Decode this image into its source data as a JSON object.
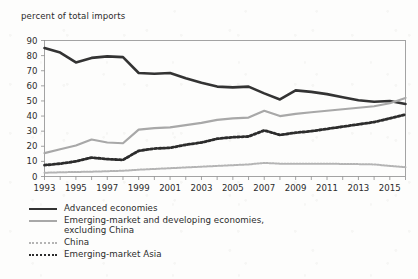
{
  "chart_data": {
    "type": "line",
    "title": "",
    "ylabel": "percent of total imports",
    "xlabel": "",
    "ylim": [
      0,
      90
    ],
    "xlim": [
      1993,
      2016
    ],
    "grid": false,
    "legend_position": "below-left",
    "yticks": [
      "0",
      "10",
      "20",
      "30",
      "40",
      "50",
      "60",
      "70",
      "80",
      "90"
    ],
    "ytick_values": [
      0,
      10,
      20,
      30,
      40,
      50,
      60,
      70,
      80,
      90
    ],
    "xticks": [
      "1993",
      "1995",
      "1997",
      "1999",
      "2001",
      "2003",
      "2005",
      "2007",
      "2009",
      "2011",
      "2013",
      "2015"
    ],
    "xtick_values": [
      1993,
      1995,
      1997,
      1999,
      2001,
      2003,
      2005,
      2007,
      2009,
      2011,
      2013,
      2015
    ],
    "x": [
      1993,
      1994,
      1995,
      1996,
      1997,
      1998,
      1999,
      2000,
      2001,
      2002,
      2003,
      2004,
      2005,
      2006,
      2007,
      2008,
      2009,
      2010,
      2011,
      2012,
      2013,
      2014,
      2015,
      2016
    ],
    "series": [
      {
        "name": "Advanced economies",
        "style": "solid",
        "color": "#333333",
        "width": 2.6,
        "values": [
          85,
          82,
          75.5,
          78.5,
          79.5,
          79,
          68.5,
          68,
          68.5,
          65,
          62,
          59.5,
          59,
          59.5,
          55,
          51,
          57,
          56,
          54.5,
          52.5,
          50.5,
          49.5,
          50,
          48
        ]
      },
      {
        "name": "Emerging-market and developing economies, excluding China",
        "style": "solid",
        "color": "#a8a8a8",
        "width": 2.2,
        "values": [
          15.5,
          18,
          20.5,
          24.5,
          22.5,
          22,
          31,
          32,
          32.5,
          34,
          35.5,
          37.5,
          38.5,
          39,
          43.5,
          40,
          41.5,
          42.5,
          43.5,
          44.5,
          45.5,
          46.5,
          48.5,
          52
        ]
      },
      {
        "name": "China",
        "style": "dotted",
        "color": "#b4b4b4",
        "width": 2,
        "values": [
          2.5,
          2.8,
          3,
          3.2,
          3.5,
          3.8,
          4.5,
          5,
          5.5,
          6,
          6.5,
          7,
          7.5,
          8,
          9,
          8.5,
          8.5,
          8.5,
          8.5,
          8.3,
          8.2,
          8,
          7,
          6.2
        ]
      },
      {
        "name": "Emerging-market Asia",
        "style": "dotted",
        "color": "#2c2c2c",
        "width": 2.8,
        "values": [
          7.5,
          8.5,
          10,
          12.5,
          11.5,
          11,
          17,
          18.5,
          19,
          21,
          22.5,
          25,
          26,
          26.5,
          30.5,
          27.5,
          29,
          30,
          31.5,
          33,
          34.5,
          36,
          38.5,
          41
        ]
      }
    ]
  }
}
